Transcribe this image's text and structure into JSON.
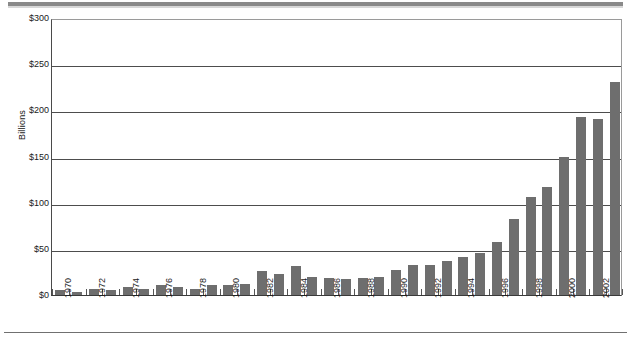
{
  "chart_data": {
    "type": "bar",
    "title": "",
    "subtitle": "",
    "xlabel": "",
    "ylabel": "Billions",
    "ylim": [
      0,
      300
    ],
    "ytick_values": [
      0,
      50,
      100,
      150,
      200,
      250,
      300
    ],
    "ytick_labels": [
      "$0",
      "$50",
      "$100",
      "$150",
      "$200",
      "$250",
      "$300"
    ],
    "grid": true,
    "legend": null,
    "legend_position": "none",
    "bar_color": "#6e6e6e",
    "gridline_color": "#4d4d4d",
    "axis_color": "#3a3a3a",
    "categories": [
      "1970",
      "1971",
      "1972",
      "1973",
      "1974",
      "1975",
      "1976",
      "1977",
      "1978",
      "1979",
      "1980",
      "1981",
      "1982",
      "1983",
      "1984",
      "1985",
      "1986",
      "1987",
      "1988",
      "1989",
      "1990",
      "1991",
      "1992",
      "1993",
      "1994",
      "1995",
      "1996",
      "1997",
      "1998",
      "1999",
      "2000",
      "2001",
      "2002",
      "2003"
    ],
    "xtick_labels": [
      "1970",
      "1972",
      "1974",
      "1976",
      "1978",
      "1980",
      "1982",
      "1984",
      "1986",
      "1988",
      "1990",
      "1992",
      "1994",
      "1996",
      "1998",
      "2000",
      "2002"
    ],
    "values": [
      5,
      3,
      6,
      5,
      9,
      6,
      11,
      9,
      7,
      11,
      11,
      12,
      26,
      23,
      31,
      19,
      18,
      17,
      18,
      20,
      27,
      33,
      33,
      37,
      41,
      46,
      57,
      82,
      106,
      117,
      150,
      193,
      191,
      231
    ],
    "values_full": [
      {
        "year": "1970",
        "value": 5
      },
      {
        "year": "1971",
        "value": 3
      },
      {
        "year": "1972",
        "value": 6
      },
      {
        "year": "1973",
        "value": 5
      },
      {
        "year": "1974",
        "value": 9
      },
      {
        "year": "1975",
        "value": 6
      },
      {
        "year": "1976",
        "value": 11
      },
      {
        "year": "1977",
        "value": 9
      },
      {
        "year": "1978",
        "value": 7
      },
      {
        "year": "1979",
        "value": 11
      },
      {
        "year": "1980",
        "value": 11
      },
      {
        "year": "1981",
        "value": 12
      },
      {
        "year": "1982",
        "value": 26
      },
      {
        "year": "1983",
        "value": 23
      },
      {
        "year": "1984",
        "value": 31
      },
      {
        "year": "1985",
        "value": 19
      },
      {
        "year": "1986",
        "value": 18
      },
      {
        "year": "1987",
        "value": 17
      },
      {
        "year": "1988",
        "value": 18
      },
      {
        "year": "1989",
        "value": 20
      },
      {
        "year": "1990",
        "value": 27
      },
      {
        "year": "1991",
        "value": 33
      },
      {
        "year": "1992",
        "value": 33
      },
      {
        "year": "1993",
        "value": 37
      },
      {
        "year": "1994",
        "value": 41
      },
      {
        "year": "1995",
        "value": 46
      },
      {
        "year": "1996",
        "value": 57
      },
      {
        "year": "1997",
        "value": 82
      },
      {
        "year": "1998",
        "value": 106
      },
      {
        "year": "1999",
        "value": 117
      },
      {
        "year": "2000",
        "value": 150
      },
      {
        "year": "2001",
        "value": 193
      },
      {
        "year": "2002",
        "value": 191
      },
      {
        "year": "2003",
        "value": 231
      }
    ]
  },
  "series_note": "",
  "axis": {
    "y_title": "Billions"
  }
}
